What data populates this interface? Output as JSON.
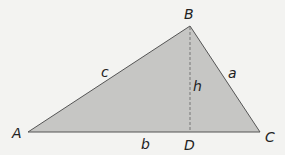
{
  "diagram": {
    "type": "triangle-with-altitude",
    "colors": {
      "background": "#f3f3f1",
      "fill": "#c6c6c4",
      "stroke": "#555555",
      "altitude": "#777777",
      "text": "#222222"
    },
    "vertices": {
      "A": {
        "label": "A",
        "x": 28,
        "y": 132
      },
      "B": {
        "label": "B",
        "x": 190,
        "y": 26
      },
      "C": {
        "label": "C",
        "x": 260,
        "y": 132
      },
      "D": {
        "label": "D",
        "x": 190,
        "y": 132
      }
    },
    "sides": {
      "a": {
        "label": "a",
        "between": "B-C"
      },
      "b": {
        "label": "b",
        "between": "A-C"
      },
      "c": {
        "label": "c",
        "between": "A-B"
      }
    },
    "altitude": {
      "label": "h",
      "from": "B",
      "to": "D",
      "style": "dashed"
    }
  }
}
